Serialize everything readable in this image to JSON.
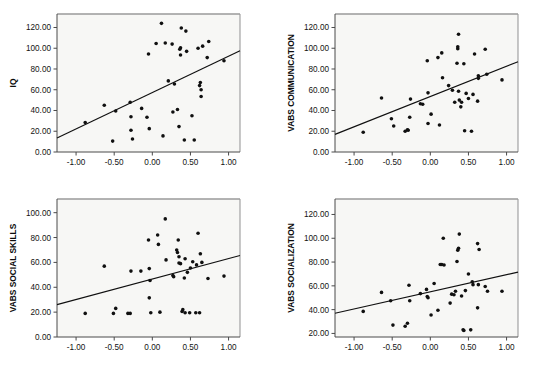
{
  "figure": {
    "background": "#ffffff",
    "panel_background": "#f7f7f5",
    "point_color": "#101010",
    "line_color": "#101010",
    "axis_color": "#4a4a4a"
  },
  "chart_data": [
    {
      "type": "scatter",
      "title": "",
      "xlabel": "",
      "ylabel": "IQ",
      "xlim": [
        -1.25,
        1.15
      ],
      "ylim": [
        0,
        133
      ],
      "grid": false,
      "legend": null,
      "xticks": [
        -1.0,
        -0.5,
        0.0,
        0.5,
        1.0
      ],
      "xticklabels": [
        "-1.00",
        "-0.50",
        "0.00",
        "0.50",
        "1.00"
      ],
      "yticks": [
        0,
        20,
        40,
        60,
        80,
        100,
        120
      ],
      "yticklabels": [
        "0.00",
        "20.00",
        "40.00",
        "60.00",
        "80.00",
        "100.00",
        "120.00"
      ],
      "points": [
        [
          -0.88,
          28.5
        ],
        [
          -0.63,
          45.0
        ],
        [
          -0.52,
          10.5
        ],
        [
          -0.48,
          39.5
        ],
        [
          -0.29,
          48.0
        ],
        [
          -0.28,
          34.0
        ],
        [
          -0.28,
          21.0
        ],
        [
          -0.26,
          12.5
        ],
        [
          -0.14,
          42.0
        ],
        [
          -0.07,
          33.5
        ],
        [
          -0.05,
          94.5
        ],
        [
          -0.04,
          22.5
        ],
        [
          0.05,
          104.5
        ],
        [
          0.12,
          124.0
        ],
        [
          0.14,
          15.5
        ],
        [
          0.17,
          105.0
        ],
        [
          0.21,
          68.5
        ],
        [
          0.26,
          104.0
        ],
        [
          0.27,
          38.5
        ],
        [
          0.29,
          65.5
        ],
        [
          0.33,
          41.0
        ],
        [
          0.35,
          24.5
        ],
        [
          0.36,
          99.0
        ],
        [
          0.37,
          100.5
        ],
        [
          0.37,
          93.5
        ],
        [
          0.38,
          119.5
        ],
        [
          0.42,
          11.5
        ],
        [
          0.44,
          116.5
        ],
        [
          0.45,
          97.0
        ],
        [
          0.52,
          35.0
        ],
        [
          0.55,
          11.5
        ],
        [
          0.6,
          100.0
        ],
        [
          0.62,
          64.0
        ],
        [
          0.63,
          67.0
        ],
        [
          0.64,
          60.0
        ],
        [
          0.64,
          53.5
        ],
        [
          0.66,
          102.0
        ],
        [
          0.72,
          91.0
        ],
        [
          0.74,
          106.5
        ],
        [
          0.94,
          88.0
        ]
      ],
      "fit_line": {
        "x0": -1.25,
        "y0": 13.5,
        "x1": 1.15,
        "y1": 97.5
      }
    },
    {
      "type": "scatter",
      "title": "",
      "xlabel": "",
      "ylabel": "VABS COMMUNICATION",
      "xlim": [
        -1.25,
        1.15
      ],
      "ylim": [
        0,
        133
      ],
      "grid": false,
      "legend": null,
      "xticks": [
        -1.0,
        -0.5,
        0.0,
        0.5,
        1.0
      ],
      "xticklabels": [
        "-1.00",
        "-0.50",
        "0.00",
        "0.50",
        "1.00"
      ],
      "yticks": [
        0,
        20,
        40,
        60,
        80,
        100,
        120
      ],
      "yticklabels": [
        "0.00",
        "20.00",
        "40.00",
        "60.00",
        "80.00",
        "100.00",
        "120.00"
      ],
      "points": [
        [
          -0.88,
          19.0
        ],
        [
          -0.64,
          52.0
        ],
        [
          -0.51,
          32.0
        ],
        [
          -0.48,
          25.0
        ],
        [
          -0.33,
          20.0
        ],
        [
          -0.3,
          21.5
        ],
        [
          -0.29,
          21.0
        ],
        [
          -0.27,
          33.5
        ],
        [
          -0.26,
          51.0
        ],
        [
          -0.13,
          46.5
        ],
        [
          -0.1,
          46.0
        ],
        [
          -0.04,
          88.0
        ],
        [
          -0.03,
          57.0
        ],
        [
          -0.03,
          27.5
        ],
        [
          0.01,
          36.5
        ],
        [
          0.1,
          91.0
        ],
        [
          0.12,
          26.0
        ],
        [
          0.15,
          95.5
        ],
        [
          0.16,
          71.5
        ],
        [
          0.24,
          64.0
        ],
        [
          0.29,
          59.5
        ],
        [
          0.32,
          48.0
        ],
        [
          0.35,
          85.5
        ],
        [
          0.36,
          101.5
        ],
        [
          0.36,
          99.5
        ],
        [
          0.37,
          113.5
        ],
        [
          0.37,
          58.5
        ],
        [
          0.38,
          50.0
        ],
        [
          0.4,
          43.5
        ],
        [
          0.41,
          48.0
        ],
        [
          0.44,
          85.0
        ],
        [
          0.45,
          20.5
        ],
        [
          0.47,
          56.5
        ],
        [
          0.5,
          51.5
        ],
        [
          0.54,
          20.0
        ],
        [
          0.56,
          55.5
        ],
        [
          0.58,
          94.5
        ],
        [
          0.62,
          49.0
        ],
        [
          0.63,
          71.0
        ],
        [
          0.63,
          73.5
        ],
        [
          0.72,
          99.0
        ],
        [
          0.74,
          75.0
        ],
        [
          0.94,
          69.5
        ]
      ],
      "fit_line": {
        "x0": -1.25,
        "y0": 17.0,
        "x1": 1.15,
        "y1": 87.0
      }
    },
    {
      "type": "scatter",
      "title": "",
      "xlabel": "",
      "ylabel": "VABS SOCIAL SKILLS",
      "xlim": [
        -1.25,
        1.15
      ],
      "ylim": [
        0,
        111
      ],
      "grid": false,
      "legend": null,
      "xticks": [
        -1.0,
        -0.5,
        0.0,
        0.5,
        1.0
      ],
      "xticklabels": [
        "-1.00",
        "-0.50",
        "0.00",
        "0.50",
        "1.00"
      ],
      "yticks": [
        0,
        20,
        40,
        60,
        80,
        100
      ],
      "yticklabels": [
        "0.00",
        "20.00",
        "40.00",
        "60.00",
        "80.00",
        "100.00"
      ],
      "points": [
        [
          -0.88,
          19.0
        ],
        [
          -0.63,
          57.0
        ],
        [
          -0.51,
          19.0
        ],
        [
          -0.48,
          23.0
        ],
        [
          -0.32,
          19.0
        ],
        [
          -0.29,
          19.0
        ],
        [
          -0.28,
          53.0
        ],
        [
          -0.15,
          53.0
        ],
        [
          -0.05,
          78.0
        ],
        [
          -0.04,
          55.0
        ],
        [
          -0.04,
          31.5
        ],
        [
          -0.03,
          45.5
        ],
        [
          -0.02,
          19.5
        ],
        [
          0.07,
          82.0
        ],
        [
          0.08,
          74.5
        ],
        [
          0.1,
          20.0
        ],
        [
          0.17,
          95.0
        ],
        [
          0.18,
          62.0
        ],
        [
          0.27,
          49.5
        ],
        [
          0.28,
          48.5
        ],
        [
          0.32,
          70.0
        ],
        [
          0.33,
          68.0
        ],
        [
          0.34,
          78.0
        ],
        [
          0.35,
          59.5
        ],
        [
          0.35,
          64.5
        ],
        [
          0.37,
          59.0
        ],
        [
          0.39,
          20.5
        ],
        [
          0.4,
          22.0
        ],
        [
          0.42,
          47.5
        ],
        [
          0.43,
          19.5
        ],
        [
          0.43,
          63.0
        ],
        [
          0.46,
          52.0
        ],
        [
          0.49,
          19.5
        ],
        [
          0.5,
          55.5
        ],
        [
          0.53,
          60.5
        ],
        [
          0.57,
          19.5
        ],
        [
          0.58,
          58.0
        ],
        [
          0.6,
          83.5
        ],
        [
          0.62,
          19.5
        ],
        [
          0.63,
          67.0
        ],
        [
          0.65,
          60.0
        ],
        [
          0.73,
          47.0
        ],
        [
          0.94,
          49.0
        ]
      ],
      "fit_line": {
        "x0": -1.25,
        "y0": 26.0,
        "x1": 1.15,
        "y1": 65.5
      }
    },
    {
      "type": "scatter",
      "title": "",
      "xlabel": "",
      "ylabel": "VABS SOCIALIZATION",
      "xlim": [
        -1.25,
        1.15
      ],
      "ylim": [
        17,
        133
      ],
      "grid": false,
      "legend": null,
      "xticks": [
        -1.0,
        -0.5,
        0.0,
        0.5,
        1.0
      ],
      "xticklabels": [
        "-1.00",
        "-0.50",
        "0.00",
        "0.50",
        "1.00"
      ],
      "yticks": [
        20,
        40,
        60,
        80,
        100,
        120
      ],
      "yticklabels": [
        "20.00",
        "40.00",
        "60.00",
        "80.00",
        "100.00",
        "120.00"
      ],
      "points": [
        [
          -0.88,
          38.5
        ],
        [
          -0.64,
          54.5
        ],
        [
          -0.52,
          47.5
        ],
        [
          -0.49,
          27.0
        ],
        [
          -0.33,
          26.0
        ],
        [
          -0.3,
          28.5
        ],
        [
          -0.28,
          60.5
        ],
        [
          -0.27,
          47.5
        ],
        [
          -0.13,
          53.5
        ],
        [
          -0.05,
          57.0
        ],
        [
          -0.04,
          51.0
        ],
        [
          -0.03,
          50.0
        ],
        [
          0.01,
          35.5
        ],
        [
          0.05,
          62.0
        ],
        [
          0.1,
          39.5
        ],
        [
          0.13,
          78.0
        ],
        [
          0.15,
          78.0
        ],
        [
          0.17,
          100.0
        ],
        [
          0.18,
          77.5
        ],
        [
          0.26,
          45.5
        ],
        [
          0.28,
          53.0
        ],
        [
          0.31,
          52.5
        ],
        [
          0.33,
          55.5
        ],
        [
          0.35,
          80.5
        ],
        [
          0.36,
          90.0
        ],
        [
          0.37,
          91.5
        ],
        [
          0.38,
          103.5
        ],
        [
          0.41,
          51.5
        ],
        [
          0.43,
          23.0
        ],
        [
          0.44,
          22.5
        ],
        [
          0.46,
          56.0
        ],
        [
          0.5,
          70.0
        ],
        [
          0.53,
          23.0
        ],
        [
          0.55,
          63.5
        ],
        [
          0.56,
          61.0
        ],
        [
          0.62,
          95.5
        ],
        [
          0.62,
          41.5
        ],
        [
          0.63,
          61.0
        ],
        [
          0.64,
          90.5
        ],
        [
          0.72,
          59.5
        ],
        [
          0.75,
          55.5
        ],
        [
          0.94,
          55.5
        ]
      ],
      "fit_line": {
        "x0": -1.25,
        "y0": 37.0,
        "x1": 1.15,
        "y1": 71.5
      }
    }
  ]
}
